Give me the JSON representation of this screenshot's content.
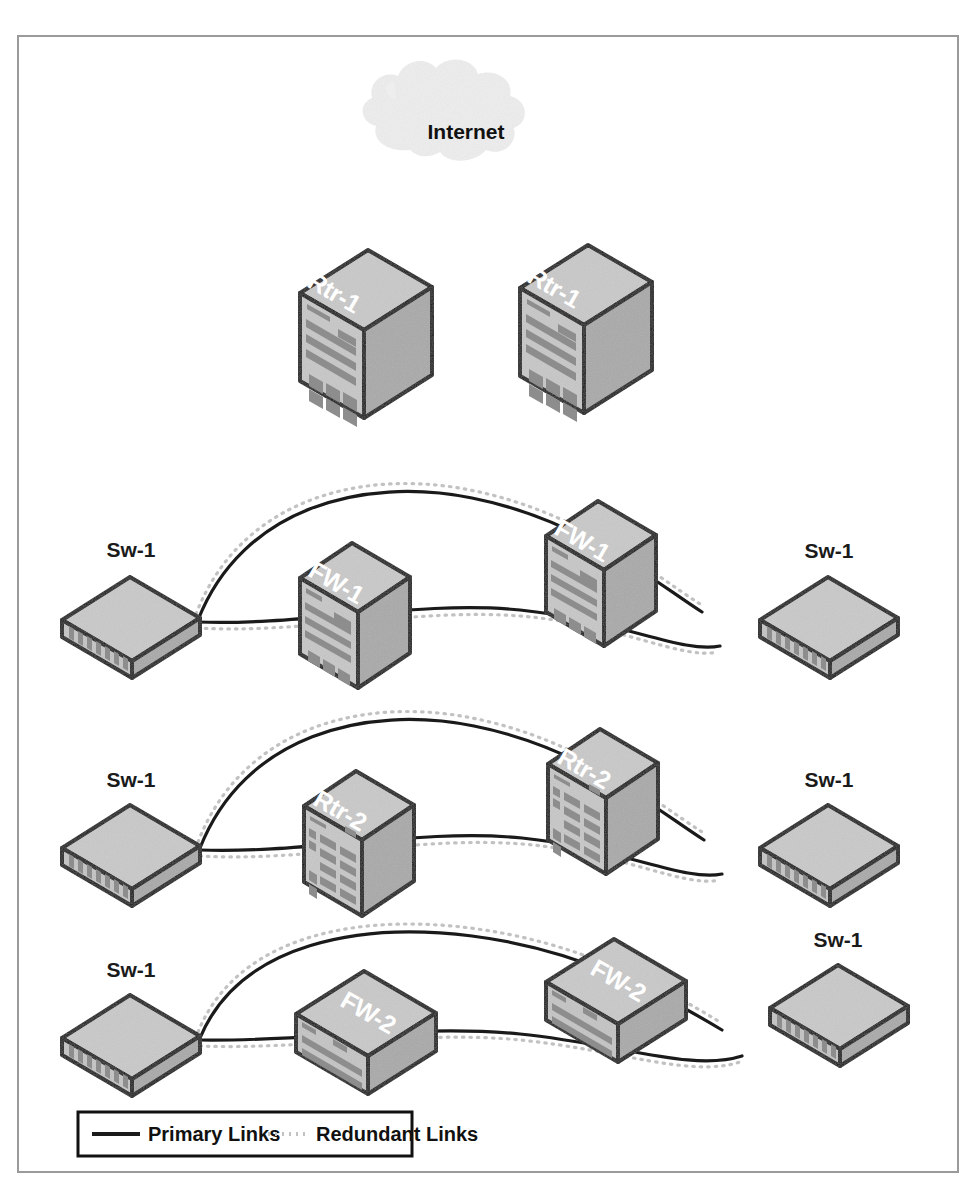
{
  "diagram": {
    "cloud": {
      "label": "Internet"
    },
    "colors": {
      "frame_border": "#9a9a9a",
      "device_outline": "#111111",
      "device_top": "#c9c9c9",
      "device_front": "#c4c4c4",
      "device_side": "#a8a8a8",
      "device_detail": "#8e8e8e",
      "primary_link": "#1a1a1a",
      "redundant_link": "#c2c2c2",
      "cloud_fill": "#eeeeee",
      "label_on_device": "#ffffff",
      "label_text": "#1a1a1a"
    },
    "rows": [
      {
        "row_name": "row-routers",
        "devices": [
          {
            "id": "rtr1-left",
            "label": "Rtr-1",
            "type": "router-tall"
          },
          {
            "id": "rtr1-right",
            "label": "Rtr-1",
            "type": "router-tall"
          }
        ]
      },
      {
        "row_name": "row-firewall-1",
        "devices": [
          {
            "id": "sw1-r1-left",
            "label": "Sw-1",
            "type": "switch-flat"
          },
          {
            "id": "fw1-left",
            "label": "FW-1",
            "type": "firewall-tall"
          },
          {
            "id": "fw1-right",
            "label": "FW-1",
            "type": "firewall-tall"
          },
          {
            "id": "sw1-r1-right",
            "label": "Sw-1",
            "type": "switch-flat"
          }
        ]
      },
      {
        "row_name": "row-router-2",
        "devices": [
          {
            "id": "sw1-r2-left",
            "label": "Sw-1",
            "type": "switch-flat"
          },
          {
            "id": "rtr2-left",
            "label": "Rtr-2",
            "type": "router-tall-grid"
          },
          {
            "id": "rtr2-right",
            "label": "Rtr-2",
            "type": "router-tall-grid"
          },
          {
            "id": "sw1-r2-right",
            "label": "Sw-1",
            "type": "switch-flat"
          }
        ]
      },
      {
        "row_name": "row-firewall-2",
        "devices": [
          {
            "id": "sw1-r3-left",
            "label": "Sw-1",
            "type": "switch-flat"
          },
          {
            "id": "fw2-left",
            "label": "FW-2",
            "type": "firewall-short"
          },
          {
            "id": "fw2-right",
            "label": "FW-2",
            "type": "firewall-short"
          },
          {
            "id": "sw1-r3-right",
            "label": "Sw-1",
            "type": "switch-flat"
          }
        ]
      }
    ],
    "legend": {
      "items": [
        {
          "key": "primary",
          "label": "Primary Links",
          "style": "solid"
        },
        {
          "key": "redundant",
          "label": "Redundant Links",
          "style": "dotted"
        }
      ]
    }
  }
}
